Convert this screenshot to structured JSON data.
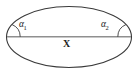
{
  "figure": {
    "type": "geometry-diagram",
    "shape": "ellipse",
    "background_color": "#ffffff",
    "stroke_color": "#3a3a3a",
    "chord_color": "#8a8a8a",
    "text_color": "#1c1c1c"
  },
  "labels": {
    "angle_left": {
      "symbol": "α",
      "subscript": "1",
      "full": "α1"
    },
    "angle_right": {
      "symbol": "α",
      "subscript": "2",
      "full": "α2"
    },
    "chord": {
      "text": "X"
    }
  },
  "geometry": {
    "ellipse": {
      "center_x": 69,
      "center_y": 37,
      "radius_x": 63,
      "radius_y": 31
    },
    "chord": {
      "x1": 7,
      "y1": 37,
      "x2": 131,
      "y2": 37
    },
    "angle_arc_left": {
      "radius": 13,
      "vertex_x": 7,
      "vertex_y": 37
    },
    "angle_arc_right": {
      "radius": 13,
      "vertex_x": 131,
      "vertex_y": 37
    }
  }
}
